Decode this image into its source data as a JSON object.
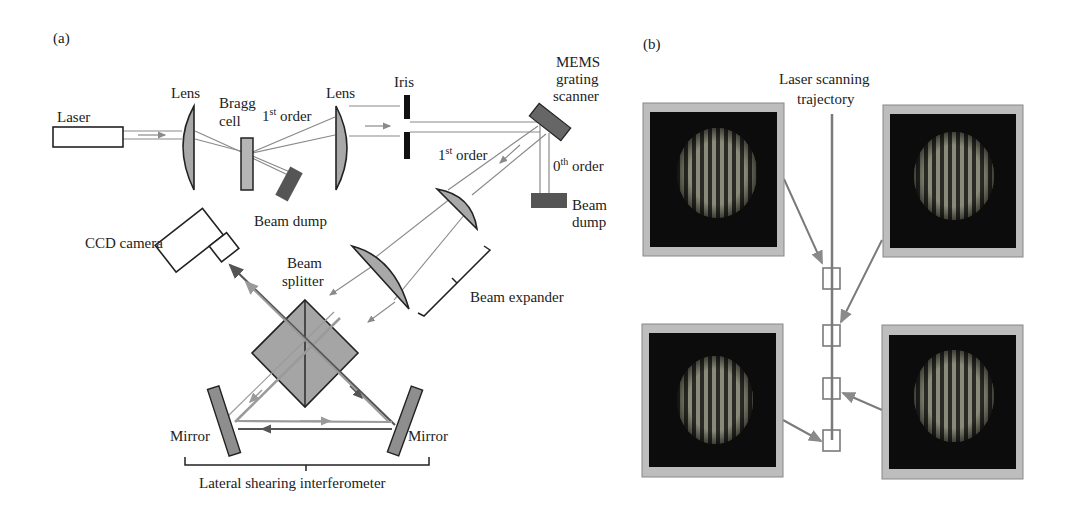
{
  "panel_a": {
    "label": "(a)",
    "components": {
      "laser": "Laser",
      "lens1": "Lens",
      "bragg_line1": "Bragg",
      "bragg_line2": "cell",
      "first_order_top_num": "1",
      "first_order_top_sup": "st",
      "first_order_top_text": " order",
      "lens2": "Lens",
      "iris": "Iris",
      "mems_line1": "MEMS",
      "mems_line2": "grating",
      "mems_line3": "scanner",
      "first_order_mid_num": "1",
      "first_order_mid_sup": "st",
      "first_order_mid_text": " order",
      "zeroth_order_num": "0",
      "zeroth_order_sup": "th",
      "zeroth_order_text": " order",
      "beam_dump_right_line1": "Beam",
      "beam_dump_right_line2": "dump",
      "beam_dump_left": "Beam dump",
      "ccd_camera": "CCD camera",
      "beam_splitter_line1": "Beam",
      "beam_splitter_line2": "splitter",
      "beam_expander": "Beam expander",
      "mirror_left": "Mirror",
      "mirror_right": "Mirror",
      "interferometer": "Lateral shearing interferometer"
    }
  },
  "panel_b": {
    "label": "(b)",
    "trajectory_line1": "Laser scanning",
    "trajectory_line2": "trajectory",
    "fringe_images": [
      {
        "position": "top-left",
        "target_marker": 1
      },
      {
        "position": "top-right",
        "target_marker": 2
      },
      {
        "position": "bottom-left",
        "target_marker": 4
      },
      {
        "position": "bottom-right",
        "target_marker": 3
      }
    ],
    "markers_count": 4
  },
  "colors": {
    "component_fill": "#a8a8a8",
    "dark_component": "#555555",
    "beam_line": "#8a8a8a",
    "image_frame": "#bdbdbd",
    "image_bg": "#0c0c0c",
    "fringe": "#8a8a7a"
  }
}
